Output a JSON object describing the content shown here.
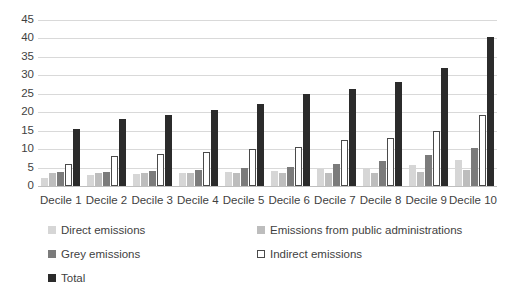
{
  "chart_data": {
    "type": "bar",
    "title": "",
    "subtitle": "",
    "xlabel": "",
    "ylabel": "",
    "ylim": [
      0,
      45
    ],
    "ytick_step": 5,
    "grid": true,
    "grid_axis": "y",
    "legend_position": "bottom",
    "categories": [
      "Decile 1",
      "Decile 2",
      "Decile 3",
      "Decile 4",
      "Decile 5",
      "Decile 6",
      "Decile 7",
      "Decile 8",
      "Decile 9",
      "Decile 10"
    ],
    "ytick_labels": [
      "45",
      "40",
      "35",
      "30",
      "25",
      "20",
      "15",
      "10",
      "5",
      "0"
    ],
    "series": [
      {
        "name": "Direct emissions",
        "color": "#d6d6d6",
        "values": [
          2.2,
          2.9,
          3.3,
          3.5,
          3.9,
          4.2,
          4.5,
          4.8,
          5.6,
          7.0
        ]
      },
      {
        "name": "Emissions from public administrations",
        "color": "#bdbdbd",
        "values": [
          3.6,
          3.5,
          3.5,
          3.5,
          3.6,
          3.5,
          3.6,
          3.6,
          3.7,
          4.3
        ]
      },
      {
        "name": "Grey emissions",
        "color": "#7b7b7b",
        "values": [
          3.7,
          3.8,
          4.1,
          4.3,
          4.8,
          5.2,
          5.9,
          6.7,
          8.4,
          10.4
        ]
      },
      {
        "name": "Indirect emissions",
        "color": "#ffffff",
        "values": [
          6.0,
          8.1,
          8.7,
          9.3,
          10.0,
          10.6,
          12.5,
          13.0,
          14.8,
          19.2
        ]
      },
      {
        "name": "Total",
        "color": "#2b2b2b",
        "values": [
          15.4,
          18.1,
          19.2,
          20.6,
          22.2,
          25.0,
          26.2,
          28.3,
          32.0,
          40.5
        ]
      }
    ]
  },
  "legend": {
    "items": [
      {
        "label": "Direct emissions",
        "swatch": "s0",
        "col": 1,
        "row": 1
      },
      {
        "label": "Emissions from public administrations",
        "swatch": "s1",
        "col": 2,
        "row": 1
      },
      {
        "label": "Grey emissions",
        "swatch": "s2",
        "col": 1,
        "row": 2
      },
      {
        "label": "Indirect emissions",
        "swatch": "s3",
        "col": 2,
        "row": 2
      },
      {
        "label": "Total",
        "swatch": "s4",
        "col": 1,
        "row": 3
      }
    ]
  }
}
